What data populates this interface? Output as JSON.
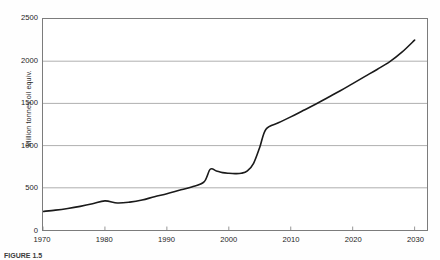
{
  "figure": {
    "caption": "FIGURE 1.5",
    "background_color": "#ffffff",
    "frame_color": "#7c7c7c",
    "grid_color": "#9a9a9a",
    "line_color": "#1a1a1a"
  },
  "chart_data": {
    "type": "line",
    "title": "",
    "subtitle": "",
    "xlabel": "",
    "ylabel": "Million tonnes oil equiv.",
    "xlim": [
      1970,
      2032
    ],
    "ylim": [
      0,
      2500
    ],
    "xticks": [
      1970,
      1980,
      1990,
      2000,
      2010,
      2020,
      2030
    ],
    "xticklabels": [
      "1970",
      "1980",
      "1990",
      "2000",
      "2010",
      "2020",
      "2030"
    ],
    "yticks": [
      0,
      500,
      1000,
      1500,
      2000,
      2500
    ],
    "yticklabels": [
      "0",
      "500",
      "1000",
      "1500",
      "2000",
      "2500"
    ],
    "grid": "horizontal",
    "legend": "none",
    "annotations": [],
    "series": [
      {
        "name": "Energy demand",
        "color": "#1a1a1a",
        "x": [
          1970,
          1972,
          1974,
          1976,
          1978,
          1980,
          1982,
          1984,
          1986,
          1988,
          1990,
          1992,
          1994,
          1996,
          1997,
          1998,
          1999,
          2000,
          2001,
          2002,
          2003,
          2004,
          2005,
          2006,
          2008,
          2010,
          2012,
          2014,
          2016,
          2018,
          2020,
          2022,
          2024,
          2026,
          2028,
          2030
        ],
        "values": [
          220,
          235,
          255,
          280,
          310,
          345,
          320,
          330,
          355,
          395,
          430,
          470,
          510,
          570,
          720,
          700,
          680,
          672,
          668,
          672,
          700,
          790,
          980,
          1195,
          1270,
          1340,
          1415,
          1490,
          1570,
          1650,
          1735,
          1820,
          1905,
          1995,
          2110,
          2250
        ]
      }
    ]
  }
}
